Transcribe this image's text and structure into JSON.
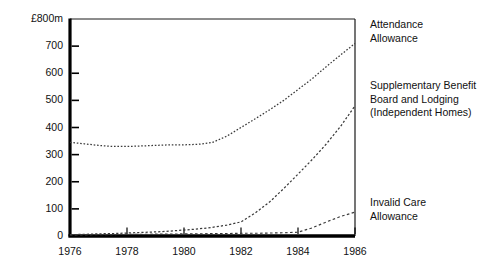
{
  "chart_data": {
    "type": "line",
    "title": "",
    "xlabel": "",
    "ylabel": "£800m",
    "yunit_label": "£800m",
    "xlim": [
      1976,
      1986
    ],
    "ylim": [
      0,
      800
    ],
    "grid": false,
    "legend_position": "right-inline",
    "ytick_labels": [
      "£800m",
      "700",
      "600",
      "500",
      "400",
      "300",
      "200",
      "100",
      "0"
    ],
    "ytick_values": [
      800,
      700,
      600,
      500,
      400,
      300,
      200,
      100,
      0
    ],
    "xtick_labels": [
      "1976",
      "1978",
      "1980",
      "1982",
      "1984",
      "1986"
    ],
    "xtick_values": [
      1976,
      1978,
      1980,
      1982,
      1984,
      1986
    ],
    "x": [
      1976,
      1976.5,
      1977,
      1977.5,
      1978,
      1978.5,
      1979,
      1979.5,
      1980,
      1980.5,
      1981,
      1981.5,
      1982,
      1982.5,
      1983,
      1983.5,
      1984,
      1984.5,
      1985,
      1985.5,
      1986
    ],
    "series": [
      {
        "name": "Attendance Allowance",
        "label_lines": [
          "Attendance",
          "Allowance"
        ],
        "style": "dotted",
        "values": [
          345,
          340,
          334,
          330,
          330,
          332,
          334,
          336,
          336,
          338,
          345,
          368,
          400,
          432,
          465,
          500,
          540,
          580,
          625,
          668,
          710
        ]
      },
      {
        "name": "Supplementary Benefit Board and Lodging (Independent Homes)",
        "label_lines": [
          "Supplementary Benefit",
          "Board and Lodging",
          "(Independent Homes)"
        ],
        "style": "dotted",
        "values": [
          5,
          6,
          8,
          9,
          11,
          13,
          15,
          18,
          22,
          26,
          32,
          40,
          52,
          85,
          125,
          175,
          228,
          282,
          340,
          405,
          480
        ]
      },
      {
        "name": "Invalid Care Allowance",
        "label_lines": [
          "Invalid Care",
          "Allowance"
        ],
        "style": "dotted",
        "values": [
          4,
          4,
          5,
          5,
          6,
          6,
          7,
          7,
          8,
          8,
          9,
          9,
          10,
          10,
          11,
          12,
          14,
          30,
          52,
          72,
          88
        ]
      }
    ]
  },
  "axis": {
    "unit_label": "£800m"
  }
}
